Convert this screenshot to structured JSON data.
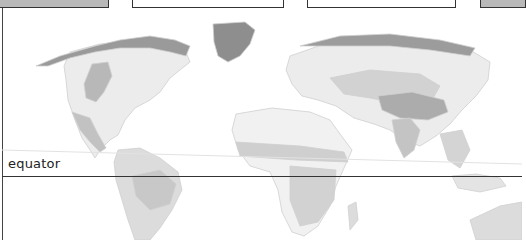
{
  "map": {
    "title": "World climate zones (grayscale)",
    "labels": {
      "equator": "equator"
    },
    "colors": {
      "background": "#ffffff",
      "land_light": "#ececec",
      "land_mid": "#d6d6d6",
      "land_dark": "#b4b4b4",
      "ice": "#8e8e8e",
      "line": "#333333",
      "topbox_gray": "#b9b9b9"
    },
    "top_boxes": [
      {
        "style": "gray",
        "x": 0,
        "w": 109
      },
      {
        "style": "white",
        "x": 132,
        "w": 152
      },
      {
        "style": "white",
        "x": 307,
        "w": 149
      },
      {
        "style": "gray",
        "x": 480,
        "w": 44
      }
    ]
  }
}
